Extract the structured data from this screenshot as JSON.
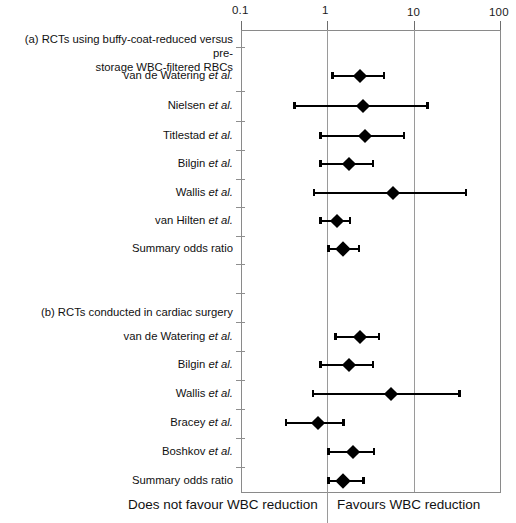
{
  "figure": {
    "axis": {
      "scale": "log",
      "tick_labels": [
        "0.1",
        "1",
        "10",
        "100"
      ],
      "tick_values": [
        0.1,
        1,
        10,
        100
      ],
      "x_min": 0.1,
      "x_max": 100
    },
    "footer": {
      "left_label": "Does not favour WBC reduction",
      "right_label": "Favours WBC reduction"
    },
    "sections": [
      {
        "id": "a",
        "heading_line1": "(a) RCTs using buffy-coat-reduced versus pre-",
        "heading_line2": "storage WBC-filtered RBCs"
      },
      {
        "id": "b",
        "heading_line1": "(b) RCTs conducted in cardiac surgery",
        "heading_line2": ""
      }
    ]
  },
  "chart_data": {
    "type": "scatter",
    "subtype": "forest-plot",
    "title": "",
    "xlabel": "Odds ratio",
    "ylabel": "",
    "xscale": "log",
    "xlim": [
      0.1,
      100
    ],
    "xticks": [
      0.1,
      1,
      10,
      100
    ],
    "xticklabels": [
      "0.1",
      "1",
      "10",
      "100"
    ],
    "grid": "vertical reference lines at 0.1, 1, 10, 100",
    "legend": "none",
    "null_line": 1,
    "annotations": [
      "Does not favour WBC reduction",
      "Favours WBC reduction"
    ],
    "groups": [
      {
        "name": "(a) RCTs using buffy-coat-reduced versus pre-storage WBC-filtered RBCs",
        "rows": [
          {
            "label": "van de Watering",
            "suffix": "et al.",
            "odds_ratio": 2.4,
            "ci_low": 1.1,
            "ci_high": 4.7,
            "is_summary": false
          },
          {
            "label": "Nielsen",
            "suffix": "et al.",
            "odds_ratio": 2.6,
            "ci_low": 0.4,
            "ci_high": 15.0,
            "is_summary": false
          },
          {
            "label": "Titlestad",
            "suffix": "et al.",
            "odds_ratio": 2.7,
            "ci_low": 0.8,
            "ci_high": 8.0,
            "is_summary": false
          },
          {
            "label": "Bilgin",
            "suffix": "et al.",
            "odds_ratio": 1.8,
            "ci_low": 0.8,
            "ci_high": 3.5,
            "is_summary": false
          },
          {
            "label": "Wallis",
            "suffix": "et al.",
            "odds_ratio": 5.8,
            "ci_low": 0.68,
            "ci_high": 42.0,
            "is_summary": false
          },
          {
            "label": "van Hilten",
            "suffix": "et al.",
            "odds_ratio": 1.3,
            "ci_low": 0.8,
            "ci_high": 1.9,
            "is_summary": false
          },
          {
            "label": "Summary odds ratio",
            "suffix": "",
            "odds_ratio": 1.5,
            "ci_low": 1.0,
            "ci_high": 2.4,
            "is_summary": true
          }
        ]
      },
      {
        "name": "(b) RCTs conducted in cardiac surgery",
        "rows": [
          {
            "label": "van de Watering",
            "suffix": "et al.",
            "odds_ratio": 2.4,
            "ci_low": 1.2,
            "ci_high": 4.1,
            "is_summary": false
          },
          {
            "label": "Bilgin",
            "suffix": "et al.",
            "odds_ratio": 1.8,
            "ci_low": 0.8,
            "ci_high": 3.5,
            "is_summary": false
          },
          {
            "label": "Wallis",
            "suffix": "et al.",
            "odds_ratio": 5.4,
            "ci_low": 0.66,
            "ci_high": 35.0,
            "is_summary": false
          },
          {
            "label": "Bracey",
            "suffix": "et al.",
            "odds_ratio": 0.78,
            "ci_low": 0.32,
            "ci_high": 1.6,
            "is_summary": false
          },
          {
            "label": "Boshkov",
            "suffix": "et al.",
            "odds_ratio": 2.0,
            "ci_low": 1.0,
            "ci_high": 3.6,
            "is_summary": false
          },
          {
            "label": "Summary odds ratio",
            "suffix": "",
            "odds_ratio": 1.5,
            "ci_low": 1.0,
            "ci_high": 2.7,
            "is_summary": true
          }
        ]
      }
    ]
  }
}
